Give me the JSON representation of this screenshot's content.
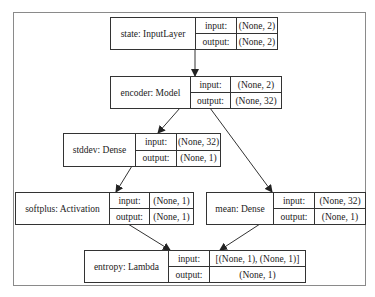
{
  "diagram": {
    "type": "keras-model-plot",
    "nodes": [
      {
        "id": "state",
        "label": "state: InputLayer",
        "input_label": "input:",
        "input": "(None, 2)",
        "output_label": "output:",
        "output": "(None, 2)"
      },
      {
        "id": "encoder",
        "label": "encoder: Model",
        "input_label": "input:",
        "input": "(None, 2)",
        "output_label": "output:",
        "output": "(None, 32)"
      },
      {
        "id": "stddev",
        "label": "stddev: Dense",
        "input_label": "input:",
        "input": "(None, 32)",
        "output_label": "output:",
        "output": "(None, 1)"
      },
      {
        "id": "softplus",
        "label": "softplus: Activation",
        "input_label": "input:",
        "input": "(None, 1)",
        "output_label": "output:",
        "output": "(None, 1)"
      },
      {
        "id": "mean",
        "label": "mean: Dense",
        "input_label": "input:",
        "input": "(None, 32)",
        "output_label": "output:",
        "output": "(None, 1)"
      },
      {
        "id": "entropy",
        "label": "entropy: Lambda",
        "input_label": "input:",
        "input": "[(None, 1), (None, 1)]",
        "output_label": "output:",
        "output": "(None, 1)"
      }
    ],
    "edges": [
      {
        "from": "state",
        "to": "encoder"
      },
      {
        "from": "encoder",
        "to": "stddev"
      },
      {
        "from": "encoder",
        "to": "mean"
      },
      {
        "from": "stddev",
        "to": "softplus"
      },
      {
        "from": "softplus",
        "to": "entropy"
      },
      {
        "from": "mean",
        "to": "entropy"
      }
    ],
    "colors": {
      "line": "#333333",
      "frame": "#8a8a8a",
      "background": "#ffffff"
    }
  }
}
